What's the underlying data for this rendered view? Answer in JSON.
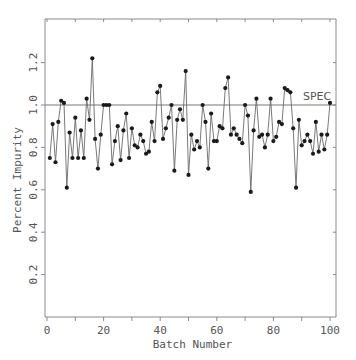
{
  "chart_data": {
    "type": "line",
    "title": "",
    "xlabel": "Batch Number",
    "ylabel": "Percent Impurity",
    "xlim": [
      0,
      102
    ],
    "ylim": [
      0,
      1.4
    ],
    "xticks": [
      0,
      20,
      40,
      60,
      80,
      100
    ],
    "xtick_minor": [
      10,
      30,
      50,
      70,
      90
    ],
    "yticks": [
      0.2,
      0.4,
      0.6,
      0.8,
      1.0,
      1.2
    ],
    "ytick_labels": [
      "0.2",
      "0.4",
      "0.6",
      "0.8",
      "1.0",
      "1.2"
    ],
    "grid": false,
    "markers": true,
    "reference_line": {
      "y": 1.0,
      "label": "SPEC"
    },
    "series": [
      {
        "name": "Percent Impurity",
        "x": [
          1,
          2,
          3,
          4,
          5,
          6,
          7,
          8,
          9,
          10,
          11,
          12,
          13,
          14,
          15,
          16,
          17,
          18,
          19,
          20,
          21,
          22,
          23,
          24,
          25,
          26,
          27,
          28,
          29,
          30,
          31,
          32,
          33,
          34,
          35,
          36,
          37,
          38,
          39,
          40,
          41,
          42,
          43,
          44,
          45,
          46,
          47,
          48,
          49,
          50,
          51,
          52,
          53,
          54,
          55,
          56,
          57,
          58,
          59,
          60,
          61,
          62,
          63,
          64,
          65,
          66,
          67,
          68,
          69,
          70,
          71,
          72,
          73,
          74,
          75,
          76,
          77,
          78,
          79,
          80,
          81,
          82,
          83,
          84,
          85,
          86,
          87,
          88,
          89,
          90,
          91,
          92,
          93,
          94,
          95,
          96,
          97,
          98,
          99,
          100
        ],
        "values": [
          0.75,
          0.91,
          0.73,
          0.92,
          1.02,
          1.01,
          0.61,
          0.87,
          0.75,
          0.94,
          0.75,
          0.88,
          0.75,
          1.03,
          0.93,
          1.22,
          0.84,
          0.7,
          0.86,
          1.0,
          1.0,
          1.0,
          0.72,
          0.83,
          0.9,
          0.74,
          0.88,
          0.96,
          0.75,
          0.89,
          0.81,
          0.8,
          0.86,
          0.83,
          0.77,
          0.78,
          0.92,
          0.83,
          1.06,
          1.09,
          0.84,
          0.89,
          0.94,
          1.0,
          0.69,
          0.93,
          0.98,
          0.93,
          1.16,
          0.67,
          0.86,
          0.79,
          0.83,
          0.8,
          1.0,
          0.92,
          0.7,
          0.96,
          0.83,
          0.83,
          0.9,
          0.89,
          1.08,
          1.13,
          0.86,
          0.89,
          0.86,
          0.84,
          0.82,
          1.0,
          0.95,
          0.59,
          0.88,
          1.03,
          0.85,
          0.86,
          0.8,
          0.86,
          1.03,
          0.83,
          0.85,
          0.92,
          0.91,
          1.08,
          1.07,
          1.06,
          0.89,
          0.61,
          0.93,
          0.81,
          0.83,
          0.86,
          0.83,
          0.77,
          0.92,
          0.78,
          0.86,
          0.79,
          0.86,
          1.01
        ]
      }
    ],
    "colors": {
      "line": "#6a6a6a",
      "marker": "#1a1a1a",
      "frame": "#8a8a8a",
      "spec_line": "#777777"
    }
  }
}
